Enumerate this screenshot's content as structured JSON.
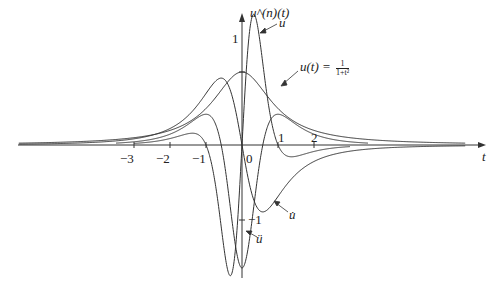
{
  "figure": {
    "y_axis_label": "u^(n)(t)",
    "x_axis_label": "t",
    "x_ticks": [
      "−3",
      "−2",
      "−1",
      "0",
      "1",
      "2"
    ],
    "y_ticks": [
      "1",
      "−1"
    ],
    "curve_labels": {
      "u": "u(t) = ",
      "u_frac_num": "1",
      "u_frac_den": "1+t²",
      "u_dot": "u̇",
      "u_ddot": "ü",
      "u_dddot": "u⃛"
    },
    "stroke_color": "#333333"
  },
  "chart_data": {
    "type": "line",
    "title": "",
    "xlabel": "t",
    "ylabel": "u^(n)(t)",
    "xlim": [
      -6.2,
      6.2
    ],
    "x_ticks": [
      -3,
      -2,
      -1,
      0,
      1,
      2
    ],
    "y_ticks": [
      1,
      -1
    ],
    "grid": false,
    "legend": "inline annotations with arrows",
    "series": [
      {
        "name": "u(t) = 1/(1+t^2)",
        "formula": "1/(1+t^2)",
        "peak": {
          "t": 0,
          "value": 1
        }
      },
      {
        "name": "u̇",
        "formula": "-2t/(1+t^2)^2",
        "extrema": [
          {
            "t": -0.58,
            "value": 0.65
          },
          {
            "t": 0.58,
            "value": -0.65
          }
        ]
      },
      {
        "name": "ü",
        "formula": "(6t^2-2)/(1+t^2)^3",
        "extrema": [
          {
            "t": 0,
            "value": -2
          }
        ]
      },
      {
        "name": "u⃛",
        "formula": "24t(1-t^2)/(1+t^2)^4",
        "extrema": [
          {
            "t": -0.32,
            "value": -4.67
          },
          {
            "t": 0.32,
            "value": 4.67
          }
        ]
      }
    ]
  }
}
